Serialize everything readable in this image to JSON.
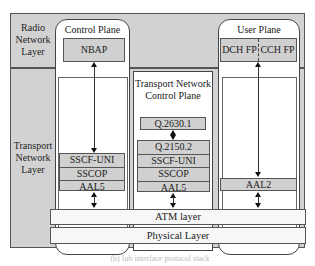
{
  "diagram": {
    "layers": {
      "radio_network": "Radio Network Layer",
      "radio_network_lines": [
        "Radio",
        "Network",
        "Layer"
      ],
      "transport_network_lines": [
        "Transport",
        "Network",
        "Layer"
      ]
    },
    "control_plane": {
      "title": "Control Plane",
      "protocol": "NBAP",
      "stack": [
        "SSCF-UNI",
        "SSCOP",
        "AAL5"
      ]
    },
    "transport_network_control_plane": {
      "title_lines": [
        "Transport Network",
        "Control Plane"
      ],
      "top_protocol": "Q.2630.1",
      "stack": [
        "Q.2150.2",
        "SSCF-UNI",
        "SSCOP",
        "AAL5"
      ]
    },
    "user_plane": {
      "title": "User Plane",
      "protocols": [
        "DCH FP",
        "CCH FP"
      ],
      "stack": [
        "AAL2"
      ]
    },
    "shared_layers": {
      "atm": "ATM layer",
      "physical": "Physical Layer"
    },
    "caption": "(b) Iub interface protocol stack"
  },
  "colors": {
    "frame_fill": "#d2d2d2",
    "box_fill": "#d0d0d0",
    "panel_fill": "#ffffff",
    "line": "#444444"
  }
}
